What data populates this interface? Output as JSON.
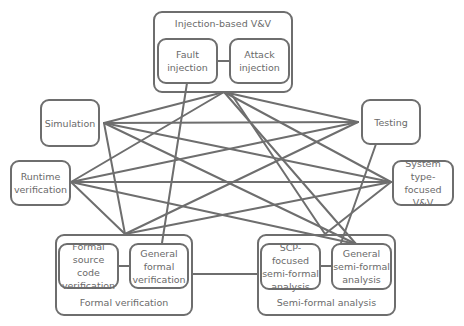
{
  "diagram": {
    "title": "",
    "groups": {
      "injection": {
        "label": "Injection-based V&V",
        "children": {
          "fault": "Fault\ninjection",
          "attack": "Attack\ninjection"
        }
      },
      "formal": {
        "label": "Formal verification",
        "children": {
          "source": "Formal\nsource code\nverification",
          "general": "General\nformal\nverification"
        }
      },
      "semi": {
        "label": "Semi-formal analysis",
        "children": {
          "scp": "SCP-focused\nsemi-formal\nanalysis",
          "general": "General\nsemi-formal\nanalysis"
        }
      }
    },
    "nodes": {
      "simulation": "Simulation",
      "testing": "Testing",
      "runtime": "Runtime\nverification",
      "system": "System type-\nfocused V&V"
    },
    "colors": {
      "line": "#6e6e6e",
      "text": "#6a6a6a",
      "background": "#ffffff"
    },
    "edges": [
      [
        "injection",
        "simulation"
      ],
      [
        "injection",
        "testing"
      ],
      [
        "injection",
        "runtime"
      ],
      [
        "injection",
        "system"
      ],
      [
        "injection",
        "formal"
      ],
      [
        "injection",
        "semi"
      ],
      [
        "fault",
        "formal-general"
      ],
      [
        "simulation",
        "testing"
      ],
      [
        "simulation",
        "system"
      ],
      [
        "simulation",
        "semi"
      ],
      [
        "simulation",
        "formal"
      ],
      [
        "testing",
        "runtime"
      ],
      [
        "testing",
        "formal"
      ],
      [
        "testing",
        "semi-general"
      ],
      [
        "runtime",
        "system"
      ],
      [
        "runtime",
        "formal"
      ],
      [
        "runtime",
        "semi"
      ],
      [
        "system",
        "formal"
      ],
      [
        "system",
        "semi"
      ],
      [
        "formal",
        "semi"
      ],
      [
        "fault",
        "attack"
      ],
      [
        "formal-source",
        "formal-general"
      ],
      [
        "semi-scp",
        "semi-general"
      ]
    ]
  }
}
